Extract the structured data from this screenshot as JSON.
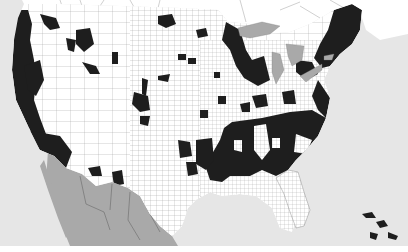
{
  "map": {
    "type": "choropleth",
    "subject": "United States counties, binary highlighted",
    "colors": {
      "ocean": "#e6e6e6",
      "land": "#ffffff",
      "county_lines": "#9a9a9a",
      "highlighted": "#1e1e1e",
      "foreign_land": "#a9a9a9",
      "lakes": "#a9a9a9",
      "canada": "#ffffff",
      "margin": "#ffffff"
    },
    "regions": {
      "highlighted_areas": [
        "Pacific Coast (Washington, Oregon, Northern California)",
        "Southern California",
        "Northern Idaho / Montana scattered counties",
        "Colorado / Utah scattered counties",
        "Arizona / New Mexico scattered counties",
        "Upper Midwest (Minnesota, Wisconsin, Michigan)",
        "New England and Northeast",
        "Mid-Atlantic",
        "Southeast (Deep South, Carolinas, Georgia, Alabama, Mississippi, Louisiana)",
        "Eastern Texas scattered counties"
      ],
      "unshaded_foreign": [
        "Mexico"
      ],
      "water_bodies": [
        "Pacific Ocean",
        "Gulf of Mexico",
        "Atlantic Ocean",
        "Great Lakes"
      ]
    }
  }
}
